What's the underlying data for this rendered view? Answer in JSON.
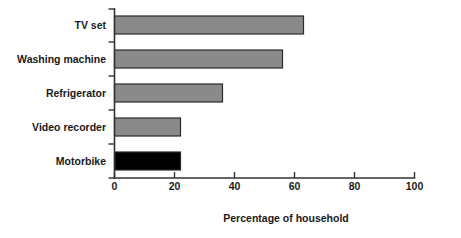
{
  "chart_data": {
    "type": "bar",
    "orientation": "horizontal",
    "title": "",
    "xlabel": "Percentage of household",
    "ylabel": "",
    "categories": [
      "TV set",
      "Washing machine",
      "Refrigerator",
      "Video recorder",
      "Motorbike"
    ],
    "values": [
      98,
      63,
      56,
      36,
      22
    ],
    "xlim": [
      0,
      100
    ],
    "xticks": [
      0,
      20,
      40,
      60,
      80,
      100
    ],
    "xtick_labels": [
      "0",
      "20",
      "40",
      "60",
      "80",
      "100"
    ],
    "grid": false,
    "legend": false,
    "bar_color": "#8a8a8a",
    "bar_border_color": "#2b2b2b",
    "axis_color": "#333333",
    "background": "#ffffff"
  }
}
